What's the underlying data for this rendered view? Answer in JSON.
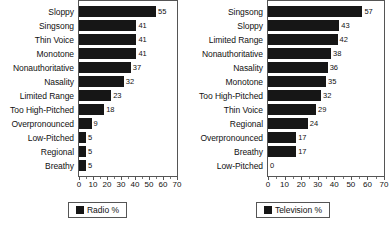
{
  "chart_data": [
    {
      "type": "bar",
      "orientation": "horizontal",
      "title": "",
      "xlabel": "",
      "ylabel": "",
      "xlim": [
        0,
        70
      ],
      "xticks": [
        0,
        10,
        20,
        30,
        40,
        50,
        60,
        70
      ],
      "grid": false,
      "legend_position": "bottom",
      "legend": [
        "Radio %"
      ],
      "series_name": "Radio %",
      "bar_color": "#161616",
      "categories": [
        "Sloppy",
        "Singsong",
        "Thin Voice",
        "Monotone",
        "Nonauthoritative",
        "Nasality",
        "Limited Range",
        "Too High-Pitched",
        "Overpronounced",
        "Low-Pitched",
        "Regional",
        "Breathy"
      ],
      "values": [
        55,
        41,
        41,
        41,
        37,
        32,
        23,
        18,
        9,
        5,
        5,
        5
      ]
    },
    {
      "type": "bar",
      "orientation": "horizontal",
      "title": "",
      "xlabel": "",
      "ylabel": "",
      "xlim": [
        0,
        70
      ],
      "xticks": [
        0,
        10,
        20,
        30,
        40,
        50,
        60,
        70
      ],
      "grid": false,
      "legend_position": "bottom",
      "legend": [
        "Television %"
      ],
      "series_name": "Television %",
      "bar_color": "#161616",
      "categories": [
        "Singsong",
        "Sloppy",
        "Limited Range",
        "Nonauthoritative",
        "Nasality",
        "Monotone",
        "Too High-Pitched",
        "Thin Voice",
        "Regional",
        "Overpronounced",
        "Breathy",
        "Low-Pitched"
      ],
      "values": [
        57,
        43,
        42,
        38,
        36,
        35,
        32,
        29,
        24,
        17,
        17,
        0
      ]
    }
  ]
}
